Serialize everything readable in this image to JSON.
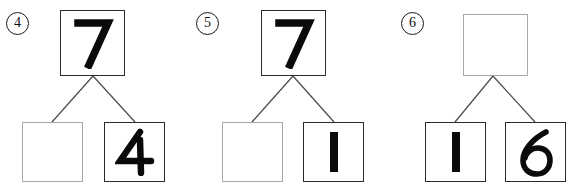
{
  "worksheet": {
    "kind": "number-bond-worksheet",
    "background_color": "#ffffff",
    "ink_color": "#0a0a0a",
    "filled_border_color": "#2b2b2b",
    "empty_border_color": "#a8a8a8",
    "groups": [
      {
        "item_label": "4",
        "whole": {
          "value": "7",
          "filled": true
        },
        "parts": [
          {
            "value": "",
            "filled": false
          },
          {
            "value": "4",
            "filled": true
          }
        ]
      },
      {
        "item_label": "5",
        "whole": {
          "value": "7",
          "filled": true
        },
        "parts": [
          {
            "value": "",
            "filled": false
          },
          {
            "value": "1",
            "filled": true
          }
        ]
      },
      {
        "item_label": "6",
        "whole": {
          "value": "",
          "filled": false
        },
        "parts": [
          {
            "value": "1",
            "filled": true
          },
          {
            "value": "6",
            "filled": true
          }
        ]
      }
    ]
  }
}
